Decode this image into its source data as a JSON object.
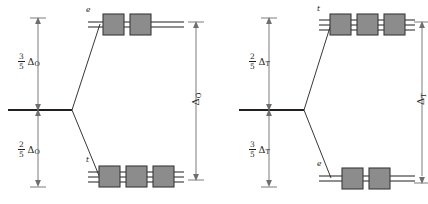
{
  "figure": {
    "kind": "crystal-field-splitting-diagrams",
    "panels": [
      {
        "id": "octahedral",
        "upper_fraction": {
          "numerator": "3",
          "denominator": "5"
        },
        "upper_delta": "Δ",
        "upper_delta_sub": "O",
        "lower_fraction": {
          "numerator": "2",
          "denominator": "5"
        },
        "lower_delta": "Δ",
        "lower_delta_sub": "O",
        "total_delta": "Δ",
        "total_delta_sub": "O",
        "upper_level_label": "e",
        "upper_level_orbitals": 2,
        "lower_level_label": "t",
        "lower_level_orbitals": 3
      },
      {
        "id": "tetrahedral",
        "upper_fraction": {
          "numerator": "2",
          "denominator": "5"
        },
        "upper_delta": "Δ",
        "upper_delta_sub": "T",
        "lower_fraction": {
          "numerator": "3",
          "denominator": "5"
        },
        "lower_delta": "Δ",
        "lower_delta_sub": "T",
        "total_delta": "Δ",
        "total_delta_sub": "T",
        "upper_level_label": "t",
        "upper_level_orbitals": 3,
        "lower_level_label": "e",
        "lower_level_orbitals": 2
      }
    ],
    "colors": {
      "line": "#231f20",
      "box_fill": "#8c8c8c",
      "box_stroke": "#3a3a3a",
      "arrow": "#6e6e6e",
      "background": "#ffffff"
    }
  }
}
